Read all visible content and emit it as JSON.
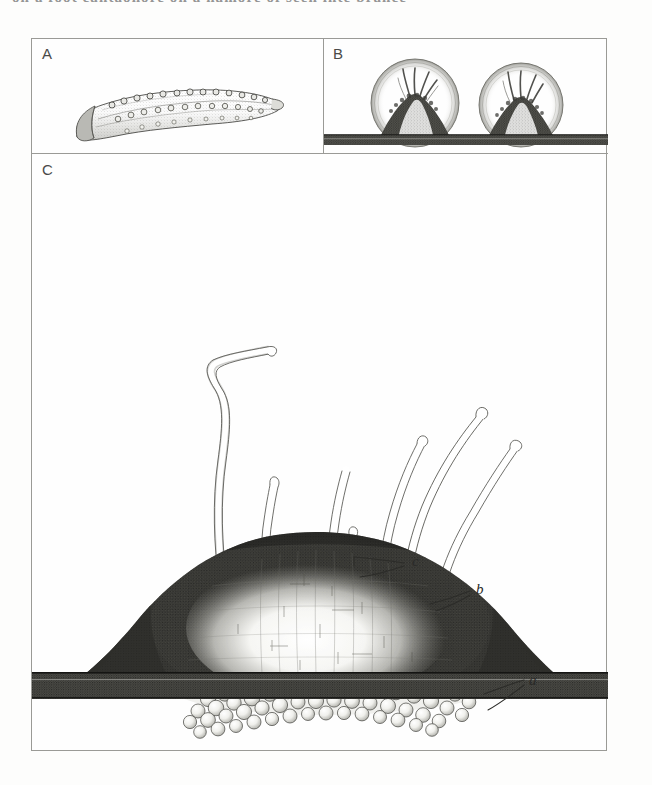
{
  "page": {
    "header_text_partial": "on a foot cantaonore on a namore of seen inte  brance",
    "background_color": "#fdfdfc",
    "ink_color": "#2a2a28"
  },
  "plate": {
    "panels": [
      {
        "id": "A",
        "letter": "A",
        "subject": "worm-like larva with paired rows of tubercles, lateral view",
        "description": "elongate curved vermiform body tapering to a blunt anterior end, dorsal and lateral rows of rounded papillae"
      },
      {
        "id": "B",
        "letter": "B",
        "subject": "two domed mounds in circular outlines resting on a substrate band",
        "description": "each mound is a dark conical heap surrounded by a circular halo, with slender tentacles rising from its apex",
        "mound_count": 2
      },
      {
        "id": "C",
        "letter": "C",
        "subject": "enlarged mound with pelleted crown and long tentacles",
        "description": "large dome-shaped mound on a dark substrate band, topped by a granular pellet layer from which long slender stippled tentacles arise"
      }
    ],
    "labels": [
      {
        "key": "a",
        "text": "a",
        "refers_to": "mound body / dome of sediment",
        "panel": "C"
      },
      {
        "key": "b",
        "text": "b",
        "refers_to": "layer of rounded faecal pellets on the crown",
        "panel": "C"
      },
      {
        "key": "c",
        "text": "c",
        "refers_to": "slender tentacles arising from the crown",
        "panel": "C"
      }
    ]
  },
  "figure_elements": {
    "panel_a_larva_label": "larva",
    "panel_b_mound_left_label": "mound-left",
    "panel_b_mound_right_label": "mound-right",
    "panel_c_mound_label": "mound",
    "panel_c_pellets_label": "pellet-crown",
    "panel_c_tentacles_label": "tentacles",
    "substrate_label": "substrate"
  }
}
